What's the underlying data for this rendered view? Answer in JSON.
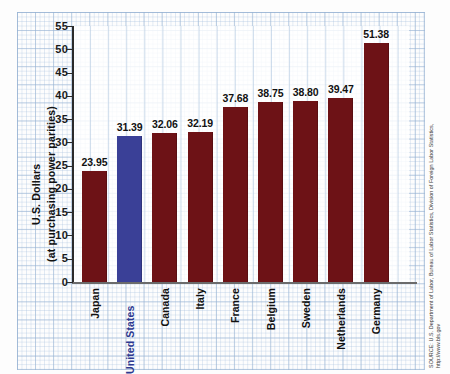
{
  "chart_data": {
    "type": "bar",
    "title": "",
    "xlabel": "",
    "ylabel": "U.S. Dollars",
    "ylabel_line2": "(at purchasing power parities)",
    "ylim": [
      0,
      55
    ],
    "yticks": [
      0,
      5,
      10,
      15,
      20,
      25,
      30,
      35,
      40,
      45,
      50,
      55
    ],
    "grid": true,
    "legend": "none",
    "categories": [
      "Japan",
      "United States",
      "Canada",
      "Italy",
      "France",
      "Belgium",
      "Sweden",
      "Netherlands",
      "Germany"
    ],
    "bars": [
      {
        "category": "Japan",
        "value": 23.95,
        "label": "23.95",
        "color": "#6d1216",
        "highlight": false
      },
      {
        "category": "United States",
        "value": 31.39,
        "label": "31.39",
        "color": "#3a4097",
        "highlight": true
      },
      {
        "category": "Canada",
        "value": 32.06,
        "label": "32.06",
        "color": "#6d1216",
        "highlight": false
      },
      {
        "category": "Italy",
        "value": 32.19,
        "label": "32.19",
        "color": "#6d1216",
        "highlight": false
      },
      {
        "category": "France",
        "value": 37.68,
        "label": "37.68",
        "color": "#6d1216",
        "highlight": false
      },
      {
        "category": "Belgium",
        "value": 38.75,
        "label": "38.75",
        "color": "#6d1216",
        "highlight": false
      },
      {
        "category": "Sweden",
        "value": 38.8,
        "label": "38.80",
        "color": "#6d1216",
        "highlight": false
      },
      {
        "category": "Netherlands",
        "value": 39.47,
        "label": "39.47",
        "color": "#6d1216",
        "highlight": false
      },
      {
        "category": "Germany",
        "value": 51.38,
        "label": "51.38",
        "color": "#6d1216",
        "highlight": false
      }
    ],
    "values": [
      23.95,
      31.39,
      32.06,
      32.19,
      37.68,
      38.75,
      38.8,
      39.47,
      51.38
    ],
    "colors": {
      "bar": "#6d1216",
      "highlight_bar": "#3a4097",
      "highlight_text": "#2d3990",
      "grid": "#96b2d2"
    }
  },
  "source": {
    "text": "SOURCE: U.S. Department of Labor, Bureau of Labor Statistics, Division of Foreign Labor Statistics, http://www.bls.gov"
  }
}
